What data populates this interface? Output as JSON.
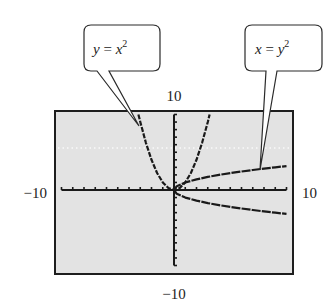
{
  "chart_data": {
    "type": "line",
    "title": "",
    "xlabel": "",
    "ylabel": "",
    "xlim": [
      -10,
      10
    ],
    "ylim": [
      -10,
      10
    ],
    "grid": false,
    "window_labels": {
      "xmin": "−10",
      "xmax": "10",
      "ymin": "−10",
      "ymax": "10"
    },
    "series": [
      {
        "name": "y = x^2",
        "equation": "y = x²",
        "x": [
          -3.16,
          -3,
          -2.5,
          -2,
          -1.5,
          -1,
          -0.5,
          0,
          0.5,
          1,
          1.5,
          2,
          2.5,
          3,
          3.16
        ],
        "y": [
          10,
          9,
          6.25,
          4,
          2.25,
          1,
          0.25,
          0,
          0.25,
          1,
          2.25,
          4,
          6.25,
          9,
          10
        ]
      },
      {
        "name": "x = y^2 (upper branch)",
        "equation": "y = √x",
        "x": [
          0,
          0.25,
          1,
          2,
          3,
          4,
          5,
          6,
          7,
          8,
          9,
          10
        ],
        "y": [
          0,
          0.5,
          1,
          1.41,
          1.73,
          2,
          2.24,
          2.45,
          2.65,
          2.83,
          3,
          3.16
        ]
      },
      {
        "name": "x = y^2 (lower branch)",
        "equation": "y = −√x",
        "x": [
          0,
          0.25,
          1,
          2,
          3,
          4,
          5,
          6,
          7,
          8,
          9,
          10
        ],
        "y": [
          0,
          -0.5,
          -1,
          -1.41,
          -1.73,
          -2,
          -2.24,
          -2.45,
          -2.65,
          -2.83,
          -3,
          -3.16
        ]
      }
    ],
    "annotations": [
      {
        "text": "y = x²",
        "points_to": "y = x^2 curve near (-3, 9)"
      },
      {
        "text": "x = y²",
        "points_to": "x = y^2 curve near (7.5, 2.7)"
      }
    ],
    "ticks": {
      "x_step": 1,
      "y_step": 1
    }
  },
  "callouts": {
    "left": {
      "var": "y",
      "eq": " = ",
      "base": "x",
      "exp": "2"
    },
    "right": {
      "var": "x",
      "eq": " = ",
      "base": "y",
      "exp": "2"
    }
  },
  "colors": {
    "screen_bg": "#e3e3e3",
    "frame": "#1e1e1e",
    "curve": "#1a1a1a",
    "dotted_line": "#ffffff"
  }
}
